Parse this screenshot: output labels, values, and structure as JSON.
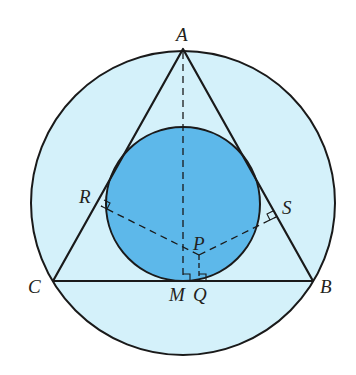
{
  "colors": {
    "outer_fill": "#d4f1fa",
    "inner_fill": "#5db8ea",
    "stroke": "#1a1a1a"
  },
  "outer_circle": {
    "cx": 183,
    "cy": 203,
    "r": 152
  },
  "inner_circle": {
    "cx": 183,
    "cy": 204,
    "r": 77
  },
  "points": {
    "A": {
      "label": "A",
      "x": 183,
      "y": 49
    },
    "B": {
      "label": "B",
      "x": 313,
      "y": 281
    },
    "C": {
      "label": "C",
      "x": 53,
      "y": 281
    },
    "M": {
      "label": "M",
      "x": 183,
      "y": 281
    },
    "Q": {
      "label": "Q",
      "x": 199,
      "y": 281
    },
    "P": {
      "label": "P",
      "x": 199,
      "y": 255
    },
    "R": {
      "label": "R",
      "x": 101,
      "y": 206
    },
    "S": {
      "label": "S",
      "x": 276,
      "y": 217
    }
  },
  "labels": {
    "A": "A",
    "B": "B",
    "C": "C",
    "M": "M",
    "Q": "Q",
    "P": "P",
    "R": "R",
    "S": "S"
  }
}
